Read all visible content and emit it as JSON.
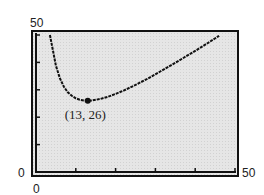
{
  "chart_data": {
    "type": "line",
    "title": "",
    "xlabel": "",
    "ylabel": "",
    "xlim": [
      0,
      50
    ],
    "ylim": [
      0,
      50
    ],
    "x_tick_labels": [
      "0",
      "50"
    ],
    "y_tick_labels": [
      "0",
      "50"
    ],
    "grid": false,
    "legend": null,
    "series": [
      {
        "name": "curve",
        "function": "y = 169/x + x",
        "x": [
          3.5,
          4,
          5,
          6,
          7,
          8,
          9,
          10,
          11,
          12,
          13,
          14,
          16,
          18,
          20,
          22,
          25,
          28,
          31,
          34,
          37,
          40,
          43,
          46
        ],
        "values": [
          51.8,
          46.3,
          38.8,
          34.2,
          31.1,
          29.1,
          27.8,
          26.9,
          26.4,
          26.1,
          26.0,
          26.1,
          26.6,
          27.4,
          28.5,
          29.7,
          31.8,
          34.0,
          36.5,
          39.0,
          41.6,
          44.2,
          46.9,
          49.7
        ]
      }
    ],
    "annotations": [
      {
        "label": "(13, 26)",
        "x": 13,
        "y": 26,
        "marker": "dot"
      }
    ],
    "colors": {
      "plot_bg": "#e4e4e4",
      "line": "#111111",
      "frame": "#111111"
    }
  }
}
